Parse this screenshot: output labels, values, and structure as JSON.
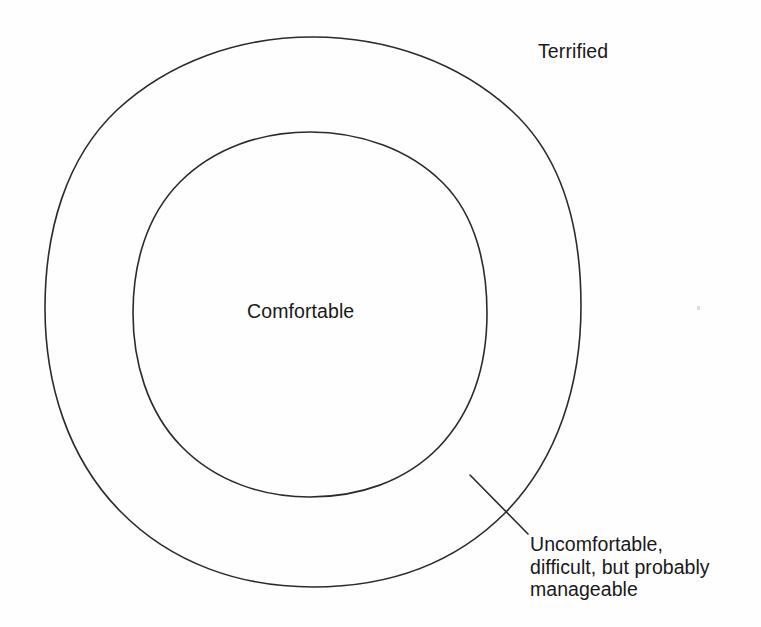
{
  "diagram": {
    "type": "concentric-zone-diagram",
    "background_color": "#fefefe",
    "stroke_color": "#2b2b2b",
    "text_color": "#191919",
    "zones": {
      "inner": {
        "label": "Comfortable",
        "shape": "ellipse",
        "center_x": 310,
        "center_y": 314,
        "radius_x": 177,
        "radius_y": 183
      },
      "middle": {
        "label_lines": [
          "Uncomfortable,",
          "difficult, but probably",
          "manageable"
        ],
        "label_line_1": "Uncomfortable,",
        "label_line_2": "difficult, but probably",
        "label_line_3": "manageable"
      },
      "outer": {
        "label": "Terrified",
        "shape": "ellipse",
        "center_x": 313,
        "center_y": 312,
        "radius_x": 268,
        "radius_y": 275
      }
    },
    "leader_line": {
      "name": "leader-line",
      "x1": 470,
      "y1": 475,
      "x2": 528,
      "y2": 534
    }
  }
}
